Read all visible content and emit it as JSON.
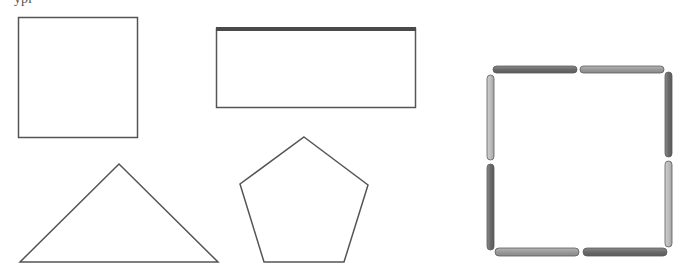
{
  "header": {
    "clipped_text": "ypl"
  },
  "colors": {
    "outline": "#555555",
    "rect_top_edge": "#4a4a4a",
    "stick_dark": "#6b6b6b",
    "stick_mid": "#9a9a9a",
    "stick_light": "#bdbdbd",
    "stick_border": "#5a5a5a"
  },
  "shapes": [
    {
      "name": "square",
      "type": "square"
    },
    {
      "name": "rectangle",
      "type": "rectangle",
      "note": "thick top edge"
    },
    {
      "name": "triangle",
      "type": "triangle"
    },
    {
      "name": "pentagon",
      "type": "pentagon"
    },
    {
      "name": "matchstick-square",
      "type": "square made of 8 sticks",
      "sticks": 8
    }
  ]
}
